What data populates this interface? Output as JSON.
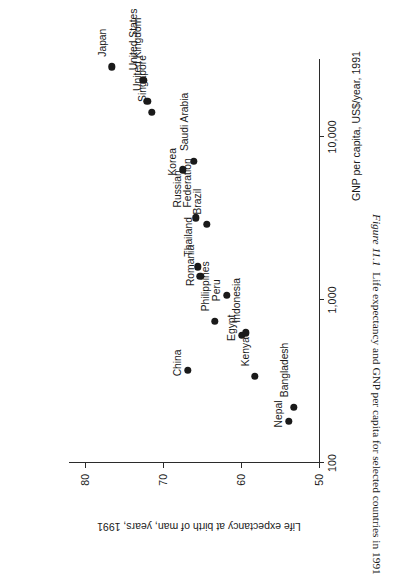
{
  "figure": {
    "number": "Figure 11.1",
    "caption": "Life expectancy and GNP per capita for selected countries in 1991"
  },
  "chart_data": {
    "type": "scatter",
    "title": "",
    "xlabel": "GNP per capita, US$/year, 1991",
    "ylabel": "Life expectancy at birth of man, years, 1991",
    "xscale": "log",
    "xlim": [
      100,
      30000
    ],
    "ylim": [
      50,
      82
    ],
    "xticks": [
      100,
      1000,
      10000
    ],
    "xticklabels": [
      "100",
      "1,000",
      "10,000"
    ],
    "yticks": [
      50,
      60,
      70,
      80
    ],
    "yticklabels": [
      "50",
      "60",
      "70",
      "80"
    ],
    "grid": false,
    "legend": false,
    "points": [
      {
        "label": "Japan",
        "gnp": 26900,
        "life": 76.5,
        "lx": 10,
        "ly": -14,
        "lines": 1
      },
      {
        "label": "United States",
        "gnp": 22200,
        "life": 72.5,
        "lx": 10,
        "ly": -14,
        "lines": 1
      },
      {
        "label": "United Kingdom",
        "gnp": 16600,
        "life": 72.0,
        "lx": 10,
        "ly": -14,
        "lines": 1
      },
      {
        "label": "Singapore",
        "gnp": 14200,
        "life": 71.4,
        "lx": 10,
        "ly": -14,
        "lines": 1
      },
      {
        "label": "Korea",
        "gnp": 6300,
        "life": 67.4,
        "lx": -6,
        "ly": -15,
        "lines": 1
      },
      {
        "label": "Saudi Arabia",
        "gnp": 7100,
        "life": 66.0,
        "lx": 10,
        "ly": -14,
        "lines": 1
      },
      {
        "label": "Russian Federation",
        "gnp": 3200,
        "life": 65.8,
        "lx": 10,
        "ly": -23,
        "lines": 2
      },
      {
        "label": "Brazil",
        "gnp": 2900,
        "life": 64.4,
        "lx": 10,
        "ly": -14,
        "lines": 1
      },
      {
        "label": "Thailand",
        "gnp": 1600,
        "life": 65.5,
        "lx": 10,
        "ly": -14,
        "lines": 1
      },
      {
        "label": "Romania",
        "gnp": 1400,
        "life": 65.2,
        "lx": -10,
        "ly": -14,
        "lines": 1
      },
      {
        "label": "Philippines",
        "gnp": 740,
        "life": 63.3,
        "lx": 10,
        "ly": -14,
        "lines": 1
      },
      {
        "label": "Peru",
        "gnp": 1070,
        "life": 61.8,
        "lx": -6,
        "ly": -15,
        "lines": 1
      },
      {
        "label": "Egypt",
        "gnp": 610,
        "life": 59.9,
        "lx": -6,
        "ly": -15,
        "lines": 1
      },
      {
        "label": "Indonesia",
        "gnp": 630,
        "life": 59.4,
        "lx": 10,
        "ly": -14,
        "lines": 1
      },
      {
        "label": "China",
        "gnp": 370,
        "life": 66.8,
        "lx": -6,
        "ly": -15,
        "lines": 1
      },
      {
        "label": "Kenya",
        "gnp": 340,
        "life": 58.2,
        "lx": 10,
        "ly": -14,
        "lines": 1
      },
      {
        "label": "Nepal",
        "gnp": 180,
        "life": 53.9,
        "lx": -6,
        "ly": -15,
        "lines": 1
      },
      {
        "label": "Bangladesh",
        "gnp": 220,
        "life": 53.2,
        "lx": 10,
        "ly": -14,
        "lines": 1
      }
    ]
  }
}
